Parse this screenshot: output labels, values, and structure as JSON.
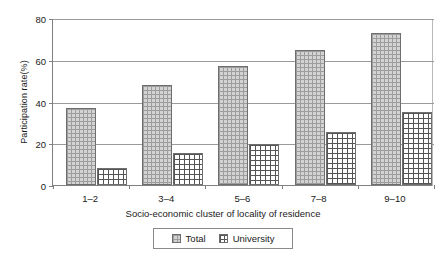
{
  "chart_data": {
    "type": "bar",
    "title": "",
    "xlabel": "Socio-economic cluster of locality of residence",
    "ylabel": "Participation rate(%)",
    "categories": [
      "1–2",
      "3–4",
      "5–6",
      "7–8",
      "9–10"
    ],
    "series": [
      {
        "name": "Total",
        "values": [
          37,
          48,
          57,
          64.5,
          73
        ]
      },
      {
        "name": "University",
        "values": [
          8,
          15.5,
          19.5,
          25.5,
          35
        ]
      }
    ],
    "ylim": [
      0,
      80
    ],
    "yticks": [
      0,
      20,
      40,
      60,
      80
    ],
    "ytick_labels": [
      "0",
      "20",
      "40",
      "60",
      "80"
    ],
    "grid": true,
    "legend_position": "bottom-center"
  },
  "legend": {
    "items": [
      {
        "label": "Total",
        "swatch": "total-pattern-swatch"
      },
      {
        "label": "University",
        "swatch": "university-pattern-swatch"
      }
    ]
  },
  "colors": {
    "total_fill": "#d3d3d3",
    "total_grid": "#9d9d9d",
    "university_fill": "#ffffff",
    "university_grid": "#555555",
    "bar_border": "#6e6e6e",
    "gridline": "#9a9a9a",
    "axis": "#808080",
    "text": "#1a1a1a"
  }
}
